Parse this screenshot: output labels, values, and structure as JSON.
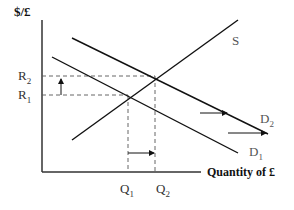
{
  "axes": {
    "y_label": "$/£",
    "x_label": "Quantity of £"
  },
  "curves": {
    "supply": {
      "label": "S"
    },
    "demand_1": {
      "label": "D",
      "subscript": "1"
    },
    "demand_2": {
      "label": "D",
      "subscript": "2"
    }
  },
  "price_levels": [
    {
      "label": "R",
      "subscript": "2"
    },
    {
      "label": "R",
      "subscript": "1"
    }
  ],
  "quantity_levels": [
    {
      "label": "Q",
      "subscript": "1"
    },
    {
      "label": "Q",
      "subscript": "2"
    }
  ],
  "colors": {
    "line": "#111111",
    "label": "#444444",
    "dashed": "#555555"
  }
}
